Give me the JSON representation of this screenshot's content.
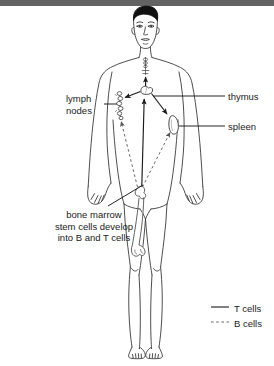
{
  "diagram": {
    "background_color": "#ffffff",
    "top_bar_color": "#636363",
    "line_color": "#1a1a1a",
    "labels": {
      "lymph_nodes_line1": "lymph",
      "lymph_nodes_line2": "nodes",
      "thymus": "thymus",
      "spleen": "spleen",
      "bone_marrow_line1": "bone marrow",
      "bone_marrow_line2": "stem cells develop",
      "bone_marrow_line3": "into B and T cells"
    },
    "legend": {
      "t_cells_label": "T cells",
      "t_cells_style": "solid",
      "b_cells_label": "B cells",
      "b_cells_style": "dashed"
    },
    "organs": [
      {
        "name": "thymus",
        "position": "upper-center-chest"
      },
      {
        "name": "lymph-nodes",
        "position": "left-axilla-chain"
      },
      {
        "name": "spleen",
        "position": "right-upper-abdomen"
      },
      {
        "name": "bone-marrow-femur",
        "position": "left-thigh"
      },
      {
        "name": "neck-lymph-chain",
        "position": "throat"
      }
    ]
  }
}
